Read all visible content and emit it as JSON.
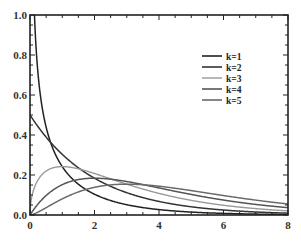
{
  "chart_data": {
    "type": "line",
    "title": "",
    "xlabel": "",
    "ylabel": "",
    "xlim": [
      0,
      8
    ],
    "ylim": [
      0,
      1.0
    ],
    "grid": false,
    "legend_position": "upper right (inside)",
    "x_ticks": [
      "0",
      "2",
      "4",
      "6",
      "8"
    ],
    "y_ticks": [
      "0.0",
      "0.2",
      "0.4",
      "0.6",
      "0.8",
      "1.0"
    ],
    "series": [
      {
        "name": "k=1",
        "k": 1,
        "color": "#222222",
        "x": [
          0.05,
          0.1,
          0.2,
          0.5,
          1,
          2,
          3,
          4,
          5,
          6,
          7,
          8
        ],
        "values": [
          1.76,
          1.2,
          0.807,
          0.439,
          0.242,
          0.104,
          0.051,
          0.027,
          0.015,
          0.008,
          0.005,
          0.003
        ]
      },
      {
        "name": "k=2",
        "k": 2,
        "color": "#333333",
        "x": [
          0,
          0.5,
          1,
          2,
          3,
          4,
          5,
          6,
          7,
          8
        ],
        "values": [
          0.5,
          0.389,
          0.303,
          0.184,
          0.112,
          0.068,
          0.041,
          0.025,
          0.015,
          0.009
        ]
      },
      {
        "name": "k=3",
        "k": 3,
        "color": "#9a9a9a",
        "x": [
          0,
          0.5,
          1,
          2,
          3,
          4,
          5,
          6,
          7,
          8
        ],
        "values": [
          0.0,
          0.22,
          0.242,
          0.208,
          0.154,
          0.108,
          0.073,
          0.048,
          0.031,
          0.02
        ]
      },
      {
        "name": "k=4",
        "k": 4,
        "color": "#555555",
        "x": [
          0,
          0.5,
          1,
          2,
          3,
          4,
          5,
          6,
          7,
          8
        ],
        "values": [
          0.0,
          0.097,
          0.152,
          0.184,
          0.167,
          0.135,
          0.103,
          0.075,
          0.053,
          0.037
        ]
      },
      {
        "name": "k=5",
        "k": 5,
        "color": "#6a6a6a",
        "x": [
          0,
          0.5,
          1,
          2,
          3,
          4,
          5,
          6,
          7,
          8
        ],
        "values": [
          0.0,
          0.037,
          0.081,
          0.138,
          0.154,
          0.144,
          0.122,
          0.096,
          0.073,
          0.054
        ]
      }
    ]
  }
}
